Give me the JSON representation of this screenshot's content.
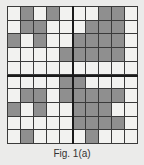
{
  "figure": {
    "caption": "Fig. 1(a)",
    "rows": 10,
    "cols": 10,
    "colors": {
      "shaded": "#8f8f8f",
      "empty": "#f2f2f0",
      "lines": "#3a3a3a",
      "axes": "#1a1a1a"
    },
    "shaded_cells": [
      [
        2,
        4,
        8,
        9
      ],
      [
        2,
        3,
        7,
        8,
        9
      ],
      [
        1,
        3,
        6,
        7,
        8,
        9
      ],
      [
        5,
        6,
        7,
        8,
        9
      ],
      [],
      [
        5,
        6
      ],
      [
        2,
        3,
        5,
        6,
        7,
        8,
        9
      ],
      [
        1,
        3,
        6,
        7,
        8
      ],
      [
        6,
        7,
        8,
        9
      ],
      [
        2,
        7
      ]
    ]
  }
}
